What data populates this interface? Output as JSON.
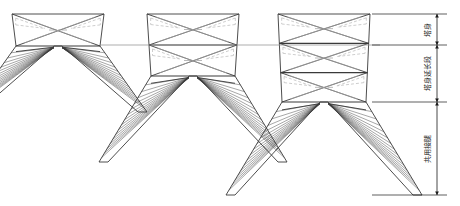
{
  "drawing": {
    "title": "输电铁塔立面图",
    "background": "#ffffff",
    "line_color": "#3a3a3a",
    "hidden_line_color": "#b9b9b9",
    "center_line_color": "#8a8a8a",
    "dimension_color": "#1a1a1a"
  },
  "towers": [
    {
      "name": "tower-short",
      "panels": 1,
      "body_top": 14,
      "body_bottom": 46,
      "leg_bottom": 112,
      "center_x": 58,
      "half_width_top": 46,
      "half_width_bottom": 42,
      "leg_spread": 47,
      "fan_lines": 15
    },
    {
      "name": "tower-medium",
      "panels": 2,
      "body_top": 14,
      "body_bottom": 76,
      "leg_bottom": 162,
      "center_x": 193,
      "half_width_top": 46,
      "half_width_bottom": 42,
      "leg_spread": 52,
      "fan_lines": 15
    },
    {
      "name": "tower-tall",
      "panels": 3,
      "body_top": 14,
      "body_bottom": 102,
      "leg_bottom": 195,
      "center_x": 324,
      "half_width_top": 46,
      "half_width_bottom": 42,
      "leg_spread": 56,
      "fan_lines": 15
    }
  ],
  "reference_line": {
    "name": "horizontal-center-reference",
    "y": 45,
    "x_start": 100,
    "x_end": 380
  },
  "dimensions": {
    "axis_x": 437,
    "extension_x_start": 372,
    "extension_x_end": 447,
    "segments": [
      {
        "id": "seg-tower-body",
        "label": "塔身",
        "y_top": 14,
        "y_bottom": 45
      },
      {
        "id": "seg-body-extension",
        "label": "塔身延长段",
        "y_top": 45,
        "y_bottom": 102
      },
      {
        "id": "seg-shared-leg",
        "label": "共用接腿",
        "y_top": 102,
        "y_bottom": 195
      }
    ]
  }
}
